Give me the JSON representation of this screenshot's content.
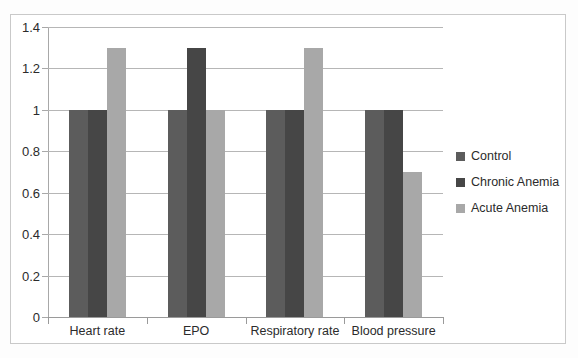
{
  "chart_data": {
    "type": "bar",
    "title": "",
    "xlabel": "",
    "ylabel": "",
    "categories": [
      "Heart rate",
      "EPO",
      "Respiratory rate",
      "Blood pressure"
    ],
    "series": [
      {
        "name": "Control",
        "color": "#5c5c5c",
        "values": [
          1.0,
          1.0,
          1.0,
          1.0
        ]
      },
      {
        "name": "Chronic Anemia",
        "color": "#464646",
        "values": [
          1.0,
          1.3,
          1.0,
          1.0
        ]
      },
      {
        "name": "Acute Anemia",
        "color": "#a8a8a8",
        "values": [
          1.3,
          1.0,
          1.3,
          0.7
        ]
      }
    ],
    "ylim": [
      0,
      1.4
    ],
    "yticks": [
      0,
      0.2,
      0.4,
      0.6,
      0.8,
      1,
      1.2,
      1.4
    ],
    "ytick_labels": [
      "0",
      "0.2",
      "0.4",
      "0.6",
      "0.8",
      "1",
      "1.2",
      "1.4"
    ],
    "grid": true,
    "legend_position": "right"
  },
  "legend": {
    "items": [
      {
        "label": "Control"
      },
      {
        "label": "Chronic Anemia"
      },
      {
        "label": "Acute Anemia"
      }
    ]
  }
}
